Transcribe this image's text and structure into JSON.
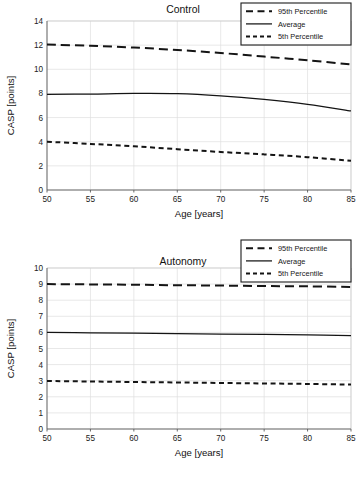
{
  "chart_data": [
    {
      "type": "line",
      "title": "Control",
      "xlabel": "Age [years]",
      "ylabel": "CASP [points]",
      "xlim": [
        50,
        85
      ],
      "ylim": [
        0,
        14
      ],
      "xticks": [
        50,
        55,
        60,
        65,
        70,
        75,
        80,
        85
      ],
      "yticks": [
        0,
        2,
        4,
        6,
        8,
        10,
        12,
        14
      ],
      "grid": true,
      "legend_position": "top-right",
      "x": [
        50,
        55,
        60,
        65,
        70,
        75,
        80,
        85
      ],
      "series": [
        {
          "name": "95th Percentile",
          "style": "long-dash",
          "values": [
            12.05,
            11.95,
            11.8,
            11.6,
            11.35,
            11.05,
            10.75,
            10.4
          ]
        },
        {
          "name": "Average",
          "style": "solid",
          "values": [
            7.92,
            7.95,
            8.0,
            7.98,
            7.8,
            7.5,
            7.1,
            6.55
          ]
        },
        {
          "name": "5th Percentile",
          "style": "short-dash",
          "values": [
            4.0,
            3.82,
            3.62,
            3.38,
            3.15,
            2.95,
            2.72,
            2.42
          ]
        }
      ]
    },
    {
      "type": "line",
      "title": "Autonomy",
      "xlabel": "Age [years]",
      "ylabel": "CASP [points]",
      "xlim": [
        50,
        85
      ],
      "ylim": [
        0,
        10
      ],
      "xticks": [
        50,
        55,
        60,
        65,
        70,
        75,
        80,
        85
      ],
      "yticks": [
        0,
        1,
        2,
        3,
        4,
        5,
        6,
        7,
        8,
        9,
        10
      ],
      "grid": true,
      "legend_position": "top-right",
      "x": [
        50,
        55,
        60,
        65,
        70,
        75,
        80,
        85
      ],
      "series": [
        {
          "name": "95th Percentile",
          "style": "long-dash",
          "values": [
            9.0,
            8.98,
            8.96,
            8.93,
            8.91,
            8.88,
            8.86,
            8.82
          ]
        },
        {
          "name": "Average",
          "style": "solid",
          "values": [
            6.0,
            5.97,
            5.95,
            5.92,
            5.89,
            5.87,
            5.84,
            5.8
          ]
        },
        {
          "name": "5th Percentile",
          "style": "short-dash",
          "values": [
            2.98,
            2.95,
            2.92,
            2.89,
            2.86,
            2.83,
            2.8,
            2.76
          ]
        }
      ]
    }
  ],
  "colors": {
    "series": "#141414",
    "grid": "#dedede",
    "axis": "#5a5a5a",
    "background": "#ffffff"
  }
}
